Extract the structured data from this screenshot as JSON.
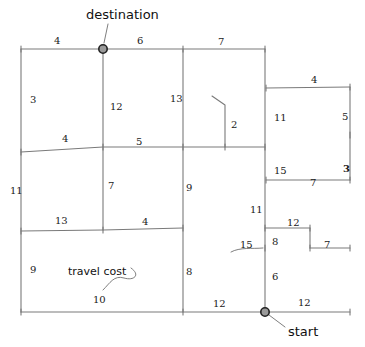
{
  "figure": {
    "type": "hand-drawn weighted grid graph",
    "background_color": "#ffffff",
    "line_color": "#7a7a7a",
    "text_color": "#1a1a1a",
    "node_fill": "#9a9a9a",
    "node_stroke": "#222222",
    "width": 365,
    "height": 347
  },
  "nodes": [
    {
      "id": "destination",
      "label": "destination",
      "x": 103,
      "y": 49,
      "label_x": 86,
      "label_y": 8
    },
    {
      "id": "start",
      "label": "start",
      "x": 265,
      "y": 312,
      "label_x": 288,
      "label_y": 325
    }
  ],
  "annotations": [
    {
      "id": "travel-cost",
      "text": "travel cost",
      "x": 68,
      "y": 266
    }
  ],
  "edge_labels": [
    {
      "id": "e-top-1",
      "value": "4",
      "x": 54,
      "y": 36,
      "bold": false
    },
    {
      "id": "e-top-2",
      "value": "6",
      "x": 137,
      "y": 36,
      "bold": false
    },
    {
      "id": "e-top-3",
      "value": "7",
      "x": 218,
      "y": 37,
      "bold": false
    },
    {
      "id": "e-left-1",
      "value": "3",
      "x": 30,
      "y": 95,
      "bold": false
    },
    {
      "id": "e-dest-down",
      "value": "12",
      "x": 110,
      "y": 102,
      "bold": false
    },
    {
      "id": "e-col3-up",
      "value": "13",
      "x": 170,
      "y": 94,
      "bold": false
    },
    {
      "id": "e-mid-left-1",
      "value": "4",
      "x": 62,
      "y": 134,
      "bold": false
    },
    {
      "id": "e-mid-left-2",
      "value": "5",
      "x": 136,
      "y": 137,
      "bold": false
    },
    {
      "id": "e-stub-2",
      "value": "2",
      "x": 231,
      "y": 120,
      "bold": false
    },
    {
      "id": "e-box-top",
      "value": "4",
      "x": 311,
      "y": 75,
      "bold": false
    },
    {
      "id": "e-box-left-up",
      "value": "11",
      "x": 274,
      "y": 113,
      "bold": false
    },
    {
      "id": "e-box-right-up",
      "value": "5",
      "x": 342,
      "y": 112,
      "bold": false
    },
    {
      "id": "e-box-left-dn",
      "value": "15",
      "x": 274,
      "y": 166,
      "bold": false
    },
    {
      "id": "e-box-bottom",
      "value": "7",
      "x": 310,
      "y": 178,
      "bold": false
    },
    {
      "id": "e-box-right-dn",
      "value": "3",
      "x": 343,
      "y": 164,
      "bold": true
    },
    {
      "id": "e-left-2",
      "value": "11",
      "x": 10,
      "y": 186,
      "bold": false
    },
    {
      "id": "e-col2-mid",
      "value": "7",
      "x": 108,
      "y": 181,
      "bold": false
    },
    {
      "id": "e-col3-mid",
      "value": "9",
      "x": 186,
      "y": 183,
      "bold": false
    },
    {
      "id": "e-row3-left",
      "value": "13",
      "x": 55,
      "y": 216,
      "bold": false
    },
    {
      "id": "e-row3-right",
      "value": "4",
      "x": 142,
      "y": 217,
      "bold": false
    },
    {
      "id": "e-col4-11",
      "value": "11",
      "x": 250,
      "y": 205,
      "bold": false
    },
    {
      "id": "e-step-12",
      "value": "12",
      "x": 287,
      "y": 218,
      "bold": false
    },
    {
      "id": "e-step-8",
      "value": "8",
      "x": 272,
      "y": 237,
      "bold": false
    },
    {
      "id": "e-step-15",
      "value": "15",
      "x": 240,
      "y": 240,
      "bold": false
    },
    {
      "id": "e-step-7",
      "value": "7",
      "x": 324,
      "y": 240,
      "bold": false
    },
    {
      "id": "e-left-3",
      "value": "9",
      "x": 30,
      "y": 265,
      "bold": false
    },
    {
      "id": "e-col3-low",
      "value": "8",
      "x": 186,
      "y": 267,
      "bold": false
    },
    {
      "id": "e-col4-6",
      "value": "6",
      "x": 272,
      "y": 272,
      "bold": false
    },
    {
      "id": "e-travelcost-10",
      "value": "10",
      "x": 93,
      "y": 295,
      "bold": false
    },
    {
      "id": "e-bottom-1",
      "value": "12",
      "x": 213,
      "y": 299,
      "bold": false
    },
    {
      "id": "e-bottom-2",
      "value": "12",
      "x": 298,
      "y": 298,
      "bold": false
    }
  ],
  "edges": [
    {
      "id": "top-row",
      "points": "21,49 103,49 183,49 265,49"
    },
    {
      "id": "row2",
      "points": "21,152 103,147 183,147 225,147 265,147"
    },
    {
      "id": "row3",
      "points": "21,231 103,230 183,228"
    },
    {
      "id": "bottom-row",
      "points": "21,312 183,312 265,312 350,312"
    },
    {
      "id": "col-left",
      "points": "21,49 21,152 21,231 21,312"
    },
    {
      "id": "col-dest",
      "points": "103,49 103,147 103,230"
    },
    {
      "id": "col-3",
      "points": "183,49 183,147 183,228 183,312"
    },
    {
      "id": "col-4",
      "points": "265,49 265,88 265,147 265,180 265,228 265,248 265,312"
    },
    {
      "id": "box-top",
      "points": "266,88 350,87"
    },
    {
      "id": "box-right",
      "points": "350,87 350,135 350,180"
    },
    {
      "id": "box-bottom",
      "points": "266,180 350,180"
    },
    {
      "id": "step-upper",
      "points": "265,228 310,228"
    },
    {
      "id": "step-drop",
      "points": "310,228 310,248"
    },
    {
      "id": "step-lower",
      "points": "310,248 350,248"
    },
    {
      "id": "stub-2",
      "points": "225,147 225,105 212,96"
    }
  ]
}
